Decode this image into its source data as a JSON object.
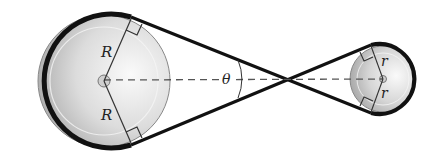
{
  "diagram": {
    "labels": {
      "large_radius_top": "R",
      "large_radius_bottom": "R",
      "small_radius_top": "r",
      "small_radius_bottom": "r",
      "angle": "θ"
    },
    "large_pulley": {
      "cx": 104,
      "cy": 81,
      "r": 66
    },
    "small_pulley": {
      "cx": 383,
      "cy": 79,
      "r": 33
    },
    "crossing_point": {
      "x": 286,
      "y": 79
    },
    "colors": {
      "belt": "#111111",
      "pulley_light": "#f2f2f2",
      "pulley_dark": "#b5b5b5",
      "dashed_line": "#555555"
    }
  }
}
